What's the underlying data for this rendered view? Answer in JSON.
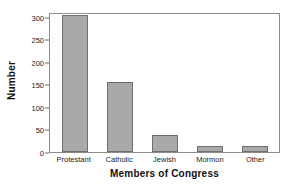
{
  "chart_data": {
    "type": "bar",
    "title": "",
    "subtitle": "",
    "xlabel": "Members of Congress",
    "ylabel": "Number",
    "categories": [
      "Protestant",
      "Catholic",
      "Jewish",
      "Mormon",
      "Other"
    ],
    "values": [
      304,
      156,
      37,
      14,
      14
    ],
    "ylim": [
      0,
      310
    ],
    "yticks": [
      0,
      50,
      100,
      150,
      200,
      250,
      300
    ],
    "ytick_labels": [
      "0",
      "50",
      "100",
      "150",
      "200",
      "250",
      "300"
    ],
    "grid": false,
    "legend": null,
    "bar_color": "#a9a9a9",
    "bar_edge_color": "#6f6f6f",
    "frame_color": "#8c8c8c",
    "text_color": "#222222"
  },
  "axes": {
    "y_title": "Number",
    "x_title": "Members of Congress"
  }
}
